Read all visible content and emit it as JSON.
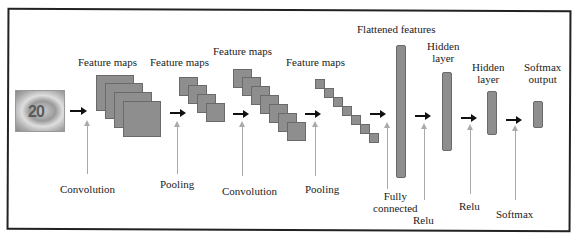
{
  "diagram": {
    "type": "cnn-architecture",
    "input": {
      "name": "input-image",
      "glyph": "20"
    },
    "top_labels": {
      "fm1": "Feature maps",
      "fm2": "Feature maps",
      "fm3": "Feature maps",
      "fm4": "Feature maps",
      "flat": "Flattened features",
      "hidden1": [
        "Hidden",
        "layer"
      ],
      "hidden2": [
        "Hidden",
        "layer"
      ],
      "softmax_out": [
        "Softmax",
        "output"
      ]
    },
    "bottom_labels": {
      "conv1": "Convolution",
      "pool1": "Pooling",
      "conv2": "Convolution",
      "pool2": "Pooling",
      "fc": [
        "Fully",
        "connected"
      ],
      "relu1": "Relu",
      "relu2": "Relu",
      "softmax": "Softmax"
    },
    "stages": [
      "Input",
      "Convolution",
      "Feature maps",
      "Pooling",
      "Feature maps",
      "Convolution",
      "Feature maps",
      "Pooling",
      "Feature maps",
      "Fully connected",
      "Flattened features",
      "Relu",
      "Hidden layer",
      "Relu",
      "Hidden layer",
      "Softmax",
      "Softmax output"
    ],
    "colors": {
      "block_fill": "#8e8e8e",
      "block_border": "#6a6a6a",
      "arrow": "#111111",
      "pointer": "#aaaaaa",
      "frame": "#222222"
    }
  }
}
